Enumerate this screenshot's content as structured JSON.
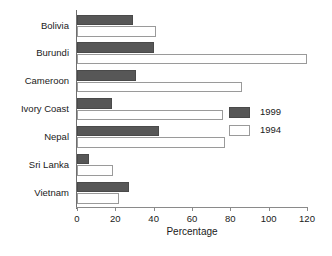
{
  "chart_data": {
    "type": "bar",
    "orientation": "horizontal",
    "title": "",
    "xlabel": "Percentage",
    "ylabel": "",
    "xlim": [
      0,
      120
    ],
    "xticks": [
      0,
      20,
      40,
      60,
      80,
      100,
      120
    ],
    "grid": false,
    "legend_position": "right",
    "categories": [
      "Bolivia",
      "Burundi",
      "Cameroon",
      "Ivory Coast",
      "Nepal",
      "Sri Lanka",
      "Vietnam"
    ],
    "series": [
      {
        "name": "1999",
        "color": "#575757",
        "values": [
          29,
          40,
          31,
          18,
          43,
          6,
          27
        ]
      },
      {
        "name": "1994",
        "color": "#ffffff",
        "values": [
          41,
          120,
          86,
          76,
          77,
          19,
          22
        ]
      }
    ]
  },
  "legend": {
    "items": [
      {
        "label": "1999"
      },
      {
        "label": "1994"
      }
    ]
  },
  "axis": {
    "x_title": "Percentage",
    "x_tick_labels": [
      "0",
      "20",
      "40",
      "60",
      "80",
      "100",
      "120"
    ]
  }
}
